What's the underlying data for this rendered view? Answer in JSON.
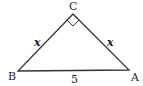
{
  "diagram": {
    "type": "right-isosceles-triangle",
    "vertices": {
      "C": {
        "label": "C",
        "x": 73,
        "y": 14
      },
      "B": {
        "label": "B",
        "x": 18,
        "y": 71
      },
      "A": {
        "label": "A",
        "x": 129,
        "y": 70
      }
    },
    "right_angle_at": "C",
    "sides": {
      "BC": {
        "label": "x"
      },
      "CA": {
        "label": "x"
      },
      "BA": {
        "label": "5"
      }
    },
    "colors": {
      "stroke": "#333333",
      "text": "#222222",
      "background": "#ffffff"
    }
  }
}
